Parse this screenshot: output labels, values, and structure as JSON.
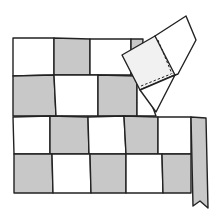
{
  "figure": {
    "title": "",
    "colors": {
      "light": "#ffffff",
      "shaded": "#c8c8c8",
      "flap_face": "#f1f1f1",
      "outline": "#222222"
    },
    "grid": {
      "rows": [
        [
          "white",
          "gray",
          "white",
          "gray"
        ],
        [
          "gray",
          "white",
          "gray"
        ],
        [
          "white",
          "gray",
          "white",
          "gray",
          "white",
          "strip"
        ],
        [
          "gray",
          "white",
          "gray",
          "white",
          "gray",
          "strip"
        ]
      ]
    },
    "elements": {
      "folded_corner": "Folded-back corner flap with dashed stitching line",
      "binding_strip": "Gray binding strip hanging on right edge with notched end"
    }
  }
}
